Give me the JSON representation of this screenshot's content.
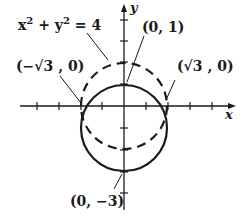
{
  "diagram": {
    "type": "coordinate-plane",
    "axes": {
      "x_label": "x",
      "y_label": "y"
    },
    "curves": [
      {
        "name": "dashed-circle",
        "equation_label": "x² + y² = 4",
        "center": [
          0,
          0
        ],
        "radius": 2,
        "style": "dashed"
      },
      {
        "name": "solid-circle",
        "center": [
          0,
          -1
        ],
        "radius": 2,
        "style": "solid"
      }
    ],
    "points": [
      {
        "label": "(0, 1)",
        "x": 0,
        "y": 1
      },
      {
        "label": "(√3 , 0)",
        "x": 1.732,
        "y": 0
      },
      {
        "label": "(−√3 , 0)",
        "x": -1.732,
        "y": 0
      },
      {
        "label": "(0, −3)",
        "x": 0,
        "y": -3
      }
    ],
    "labels": {
      "equation_base_x": "x",
      "equation_exp": "2",
      "equation_plus_y": " + y",
      "equation_eq": " = 4",
      "point_top": "(0, 1)",
      "point_right": "(√3 , 0)",
      "point_left": "(−√3 , 0)",
      "point_bottom": "(0, −3)",
      "x_axis": "x",
      "y_axis": "y"
    }
  }
}
